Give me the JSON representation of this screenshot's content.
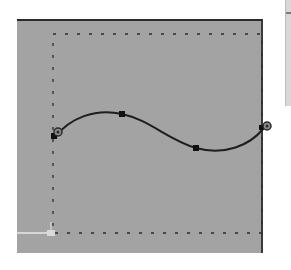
{
  "editor": {
    "canvas_background": "#a3a3a3",
    "page_background": "#ffffff",
    "bounding_box": {
      "style": "dashed",
      "color": "#2b2b2b",
      "x": 53,
      "y": 34,
      "width": 209,
      "height": 199
    },
    "origin_marker": {
      "color": "#d6d6d6",
      "x": 51,
      "y": 233
    },
    "curve": {
      "stroke": "#1e1e1e",
      "stroke_width": 2,
      "start_point": {
        "x": 55,
        "y": 137
      },
      "end_point": {
        "x": 263,
        "y": 129
      },
      "anchor_nodes": [
        {
          "x": 122,
          "y": 114
        },
        {
          "x": 196,
          "y": 148
        }
      ],
      "endpoint_handles": [
        {
          "x": 58,
          "y": 132
        },
        {
          "x": 267,
          "y": 126
        }
      ]
    }
  },
  "icons": {
    "start_handle": "circle-handle-icon",
    "end_handle": "circle-handle-icon",
    "node": "square-node-icon"
  }
}
